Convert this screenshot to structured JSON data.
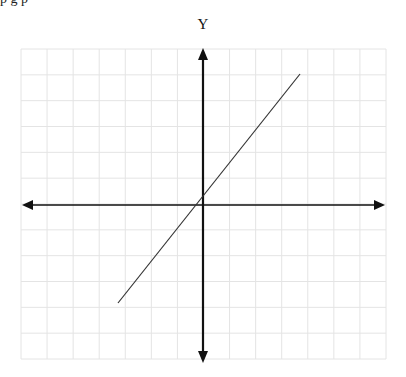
{
  "top_clipped_text": "p                    g p",
  "axes": {
    "y_label": "Y",
    "x_label": ""
  },
  "grid": {
    "columns": 14,
    "rows": 12,
    "left_px": 21,
    "top_px": 49,
    "right_px": 386,
    "bottom_px": 359,
    "line_color": "#e4e4e4"
  },
  "origin_px": {
    "x": 203,
    "y": 205
  },
  "line": {
    "color": "#333333",
    "start_px": {
      "x": 118,
      "y": 303
    },
    "end_px": {
      "x": 300,
      "y": 74
    }
  },
  "axis_color": "#111111"
}
